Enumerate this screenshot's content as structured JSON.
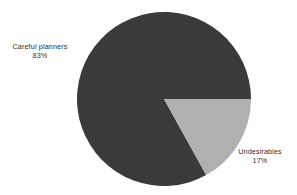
{
  "chart_data": {
    "type": "pie",
    "title": "",
    "subtitle": "",
    "xlabel": "",
    "ylabel": "",
    "grid": false,
    "legend_position": "none",
    "labels_position": "outside",
    "units": "percent",
    "categories": [
      "Careful planners",
      "Undesirables"
    ],
    "values": [
      83,
      17
    ],
    "slices": [
      {
        "label": "Careful planners",
        "value": 83,
        "value_text": "83%",
        "color": "#3a3a3a",
        "start_angle_deg": 61,
        "end_angle_deg": 360
      },
      {
        "label": "Undesirables",
        "value": 17,
        "value_text": "17%",
        "color": "#b0b0b0",
        "start_angle_deg": 0,
        "end_angle_deg": 61
      }
    ],
    "geometry": {
      "center_x": 164,
      "center_y": 99,
      "radius": 87
    },
    "colors": {
      "background": "#ffffff",
      "text": "#2e2e2e",
      "slice_careful_planners": "#3a3a3a",
      "slice_undesirables": "#b0b0b0"
    }
  },
  "labels": {
    "careful_planners": {
      "name": "Careful planners",
      "value": "83%"
    },
    "undesirables": {
      "name": "Undesirables",
      "value": "17%"
    }
  }
}
